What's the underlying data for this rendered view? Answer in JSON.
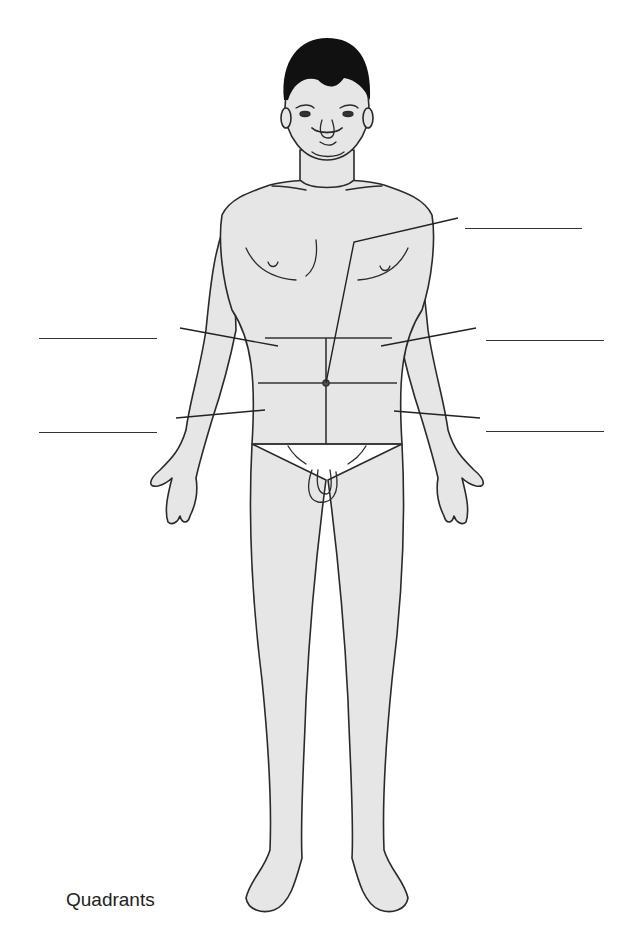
{
  "diagram": {
    "title": "Quadrants",
    "type": "anatomical-labeling-worksheet",
    "figure": "anterior view of adult male body with abdomen divided into four quadrants",
    "colors": {
      "skin_fill": "#e6e6e6",
      "outline": "#2a2a2a",
      "hair": "#111111",
      "background": "#ffffff"
    },
    "label_blanks": [
      {
        "id": "umbilicus",
        "side": "right",
        "x1": 465,
        "x2": 582,
        "y": 228,
        "points_to": "umbilicus"
      },
      {
        "id": "upper-left-quadrant-of-image",
        "side": "left",
        "x1": 39,
        "x2": 157,
        "y": 338,
        "points_to": "upper quadrant (image left)"
      },
      {
        "id": "upper-right-quadrant-of-image",
        "side": "right",
        "x1": 486,
        "x2": 604,
        "y": 340,
        "points_to": "upper quadrant (image right)"
      },
      {
        "id": "lower-left-quadrant-of-image",
        "side": "left",
        "x1": 39,
        "x2": 157,
        "y": 432,
        "points_to": "lower quadrant (image left)"
      },
      {
        "id": "lower-right-quadrant-of-image",
        "side": "right",
        "x1": 486,
        "x2": 604,
        "y": 431,
        "points_to": "lower quadrant (image right)"
      }
    ]
  }
}
